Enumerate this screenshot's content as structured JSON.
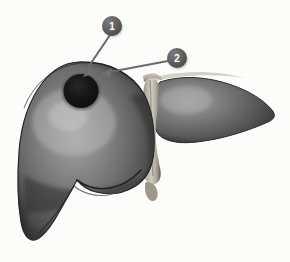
{
  "figure": {
    "background_color": "#fdfdfc",
    "organ": {
      "name": "liver",
      "body_color": "#6e6e6e",
      "shadow_color": "#2f2f2f",
      "highlight_color": "#9b9b9b",
      "outline_color": "#262626",
      "lobes": [
        {
          "name": "right-hepatic-lobe",
          "position": "viewer-left",
          "size": "large"
        },
        {
          "name": "left-hepatic-lobe",
          "position": "viewer-right",
          "size": "small"
        }
      ],
      "ligament": {
        "name": "falciform-ligament",
        "color": "#c3bdb2"
      },
      "lesion": {
        "name": "focal-lesion",
        "color": "#111111",
        "shape": "round",
        "location": "superior-right-lobe"
      }
    },
    "callouts": [
      {
        "id": "1",
        "label": "1",
        "marker_color": "#5d5d5d",
        "marker_center": {
          "x": 112,
          "y": 26
        },
        "marker_radius": 10,
        "leader_color": "#6a6a6a",
        "arrow_tip": {
          "x": 83,
          "y": 76
        }
      },
      {
        "id": "2",
        "label": "2",
        "marker_color": "#5d5d5d",
        "marker_center": {
          "x": 177,
          "y": 58
        },
        "marker_radius": 10,
        "leader_color": "#6a6a6a",
        "arrow_tip": {
          "x": 100,
          "y": 74
        }
      }
    ]
  }
}
